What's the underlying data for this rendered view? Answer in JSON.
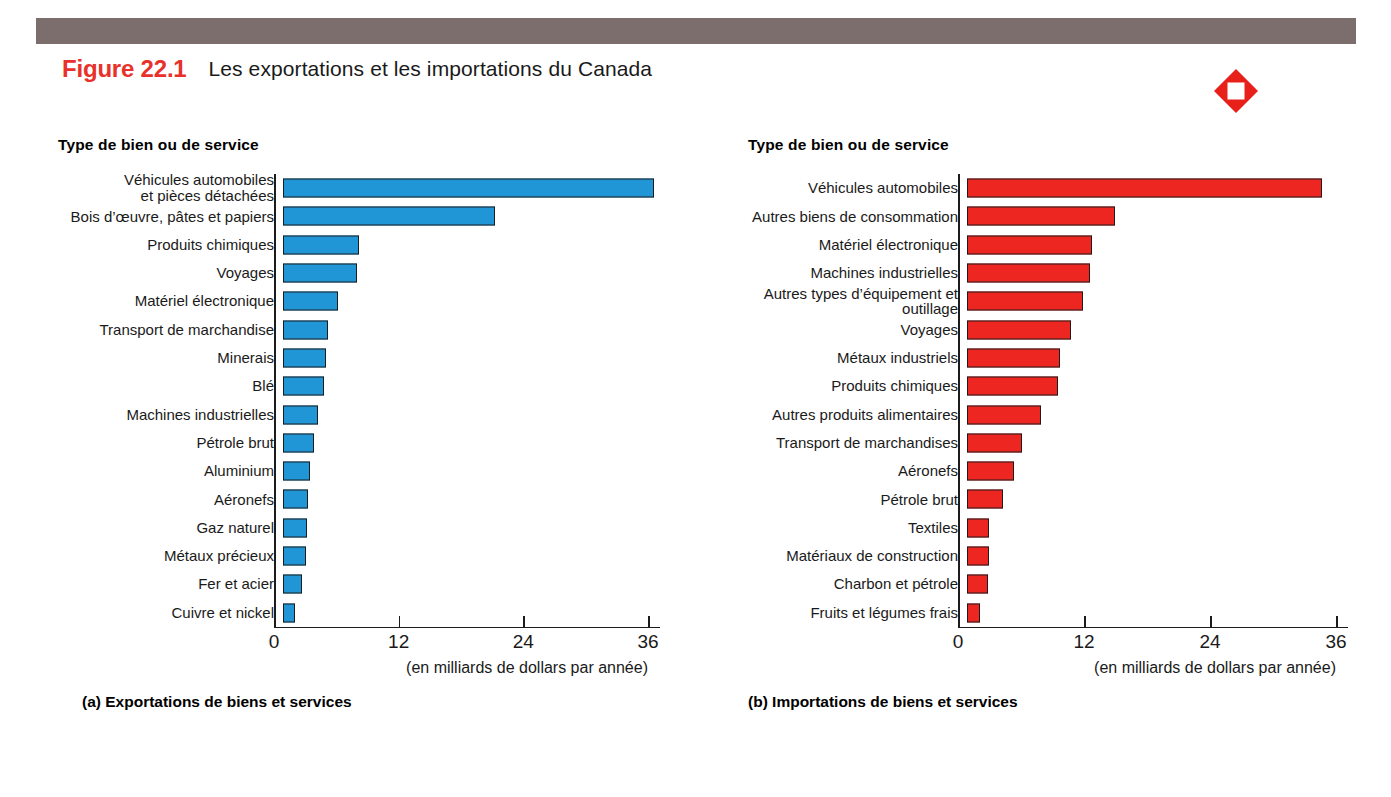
{
  "figure": {
    "number": "Figure 22.1",
    "title": "Les exportations et les importations du Canada",
    "icon": "red-diamond-icon",
    "header_bar_color": "#7d6e6e",
    "number_color": "#e8312a"
  },
  "panel_a": {
    "axis_header": "Type de bien ou de service",
    "caption": "(a) Exportations de biens et services",
    "axis_caption": "(en milliards de dollars par année)"
  },
  "panel_b": {
    "axis_header": "Type de bien ou de service",
    "caption": "(b) Importations de biens et services",
    "axis_caption": "(en milliards de dollars par année)"
  },
  "chart_data": [
    {
      "type": "bar",
      "orientation": "horizontal",
      "id": "exportations",
      "title": "(a) Exportations de biens et services",
      "ylabel": "Type de bien ou de service",
      "xlabel": "(en milliards de dollars par année)",
      "xlim": [
        0,
        36
      ],
      "xticks": [
        0,
        12,
        24,
        36
      ],
      "xticklabels": [
        "0",
        "12",
        "24",
        "36"
      ],
      "grid": false,
      "legend": "none",
      "color": "#2196d6",
      "categories": [
        "Véhicules automobiles\net pièces détachées",
        "Bois d’œuvre, pâtes et papiers",
        "Produits chimiques",
        "Voyages",
        "Matériel électronique",
        "Transport de marchandise",
        "Minerais",
        "Blé",
        "Machines industrielles",
        "Pétrole brut",
        "Aluminium",
        "Aéronefs",
        "Gaz naturel",
        "Métaux précieux",
        "Fer et acier",
        "Cuivre et nickel"
      ],
      "values": [
        35.7,
        20.4,
        7.3,
        7.1,
        5.3,
        4.3,
        4.1,
        3.9,
        3.4,
        3.0,
        2.6,
        2.4,
        2.3,
        2.2,
        1.8,
        1.2
      ]
    },
    {
      "type": "bar",
      "orientation": "horizontal",
      "id": "importations",
      "title": "(b) Importations de biens et services",
      "ylabel": "Type de bien ou de service",
      "xlabel": "(en milliards de dollars par année)",
      "xlim": [
        0,
        36
      ],
      "xticks": [
        0,
        12,
        24,
        36
      ],
      "xticklabels": [
        "0",
        "12",
        "24",
        "36"
      ],
      "grid": false,
      "legend": "none",
      "color": "#ee2622",
      "categories": [
        "Véhicules automobiles",
        "Autres biens de consommation",
        "Matériel électronique",
        "Machines industrielles",
        "Autres types d’équipement et\noutillage",
        "Voyages",
        "Métaux industriels",
        "Produits chimiques",
        "Autres produits alimentaires",
        "Transport de marchandises",
        "Aéronefs",
        "Pétrole brut",
        "Textiles",
        "Matériaux de construction",
        "Charbon et pétrole",
        "Fruits et légumes frais"
      ],
      "values": [
        33.8,
        14.1,
        11.9,
        11.7,
        11.0,
        9.9,
        8.9,
        8.7,
        7.0,
        5.2,
        4.5,
        3.4,
        2.1,
        2.1,
        2.0,
        1.2
      ]
    }
  ]
}
